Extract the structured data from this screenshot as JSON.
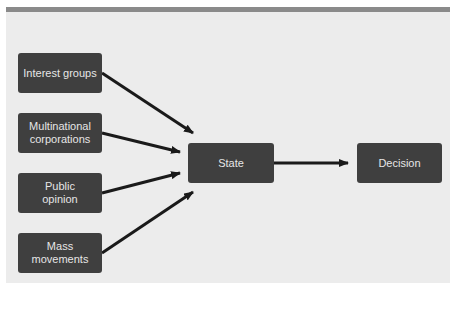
{
  "diagram": {
    "inputs": [
      {
        "label": "Interest groups"
      },
      {
        "label": "Multinational corporations"
      },
      {
        "label": "Public opinion"
      },
      {
        "label": "Mass movements"
      }
    ],
    "center": {
      "label": "State"
    },
    "output": {
      "label": "Decision"
    },
    "colors": {
      "box": "#3f3f3f",
      "box_text": "#e6e6e6",
      "panel": "#ececec",
      "arrow": "#1a1a1a",
      "topbar": "#8a8a8a"
    }
  }
}
